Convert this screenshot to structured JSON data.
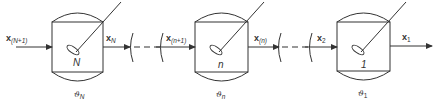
{
  "diagram": {
    "type": "cascade of stirred tank reactors",
    "tanks": [
      {
        "id": "tank-N",
        "label": "N",
        "temperature_label": "ϑ",
        "temperature_sub": "N"
      },
      {
        "id": "tank-n",
        "label": "n",
        "temperature_label": "ϑ",
        "temperature_sub": "n"
      },
      {
        "id": "tank-1",
        "label": "1",
        "temperature_label": "ϑ",
        "temperature_sub": "1"
      }
    ],
    "streams": [
      {
        "id": "x-N-plus-1",
        "main": "x",
        "sub": "(N+1)"
      },
      {
        "id": "x-N",
        "main": "x",
        "sub": "N"
      },
      {
        "id": "x-n-plus-1",
        "main": "x",
        "sub": "(n+1)"
      },
      {
        "id": "x-n",
        "main": "x",
        "sub": "(n)"
      },
      {
        "id": "x-2",
        "main": "x",
        "sub": "2"
      },
      {
        "id": "x-1",
        "main": "x",
        "sub": "1"
      }
    ]
  }
}
